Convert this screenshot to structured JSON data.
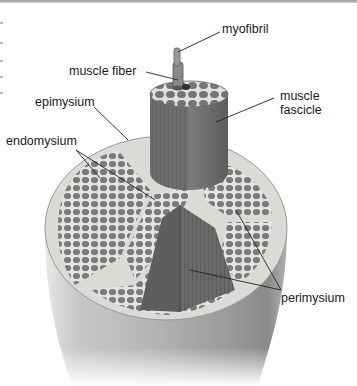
{
  "figure": {
    "style": "grayscale anatomical illustration",
    "colors": {
      "background": "#ffffff",
      "epimysium_sheath": "#d9d9d6",
      "fascicle_tissue": "#6f6f6f",
      "fiber_cells": "#7b7b7b",
      "connective_lines": "#e6e6e4",
      "cylinder_shading": "#a8a8a8",
      "label_text": "#1a1a1a",
      "leader_lines": "#222222"
    },
    "labels": {
      "myofibril": "myofibril",
      "muscle_fiber": "muscle fiber",
      "epimysium": "epimysium",
      "endomysium": "endomysium",
      "muscle_fascicle_line1": "muscle",
      "muscle_fascicle_line2": "fascicle",
      "perimysium": "perimysium"
    }
  }
}
